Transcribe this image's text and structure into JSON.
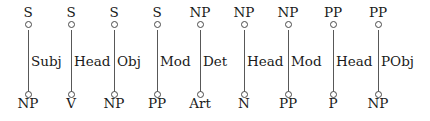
{
  "diagram": {
    "type": "dependency-relation-chain",
    "background_color": "#ffffff",
    "text_color": "#1a1a1a",
    "edge_color": "#585858",
    "node_color": "#4a4a4a",
    "columns": [
      {
        "top": "S",
        "relation": "Subj",
        "bottom": "NP",
        "x": 28
      },
      {
        "top": "S",
        "relation": "Head",
        "bottom": "V",
        "x": 71
      },
      {
        "top": "S",
        "relation": "Obj",
        "bottom": "NP",
        "x": 114
      },
      {
        "top": "S",
        "relation": "Mod",
        "bottom": "PP",
        "x": 157
      },
      {
        "top": "NP",
        "relation": "Det",
        "bottom": "Art",
        "x": 200
      },
      {
        "top": "NP",
        "relation": "Head",
        "bottom": "N",
        "x": 244
      },
      {
        "top": "NP",
        "relation": "Mod",
        "bottom": "PP",
        "x": 288
      },
      {
        "top": "PP",
        "relation": "Head",
        "bottom": "P",
        "x": 333
      },
      {
        "top": "PP",
        "relation": "PObj",
        "bottom": "NP",
        "x": 378
      }
    ]
  }
}
